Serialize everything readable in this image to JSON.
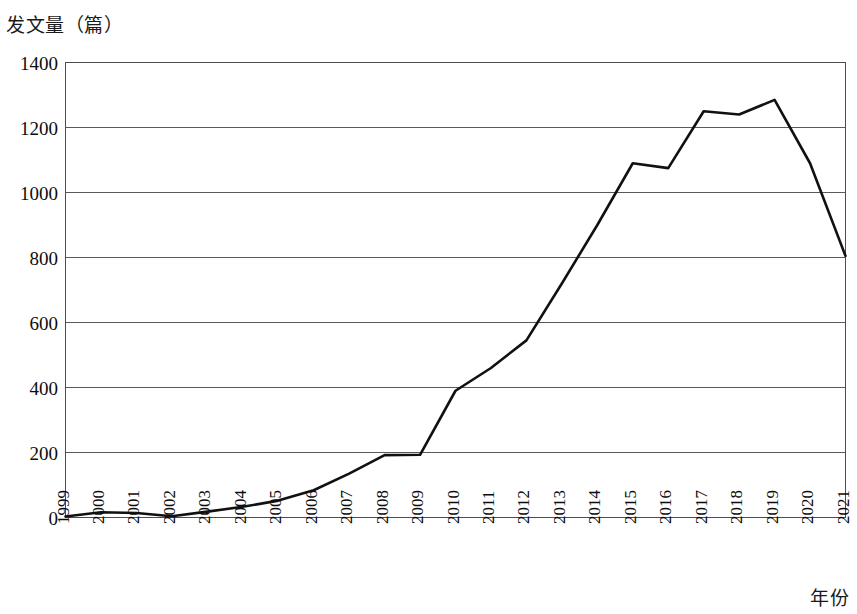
{
  "chart_data": {
    "type": "line",
    "title": "",
    "ylabel": "发文量（篇）",
    "xlabel": "年份",
    "categories": [
      "1999",
      "2000",
      "2001",
      "2002",
      "2003",
      "2004",
      "2005",
      "2006",
      "2007",
      "2008",
      "2009",
      "2010",
      "2011",
      "2012",
      "2013",
      "2014",
      "2015",
      "2016",
      "2017",
      "2018",
      "2019",
      "2020",
      "2021"
    ],
    "values": [
      3,
      16,
      14,
      4,
      18,
      33,
      52,
      84,
      135,
      192,
      193,
      390,
      460,
      545,
      720,
      900,
      1090,
      1075,
      1250,
      1240,
      1285,
      1090,
      805
    ],
    "series": [
      {
        "name": "发文量",
        "color": "#111111",
        "values": [
          3,
          16,
          14,
          4,
          18,
          33,
          52,
          84,
          135,
          192,
          193,
          390,
          460,
          545,
          720,
          900,
          1090,
          1075,
          1250,
          1240,
          1285,
          1090,
          805
        ]
      }
    ],
    "ylim": [
      0,
      1400
    ],
    "yticks": [
      0,
      200,
      400,
      600,
      800,
      1000,
      1200,
      1400
    ],
    "ytick_labels": [
      "0",
      "200",
      "400",
      "600",
      "800",
      "1000",
      "1200",
      "1400"
    ],
    "grid": "horizontal",
    "legend": "none",
    "markers": "none",
    "line_color": "#111111",
    "grid_color": "#5a5a5a",
    "border_color": "#4d4d4d",
    "background": "#ffffff"
  }
}
